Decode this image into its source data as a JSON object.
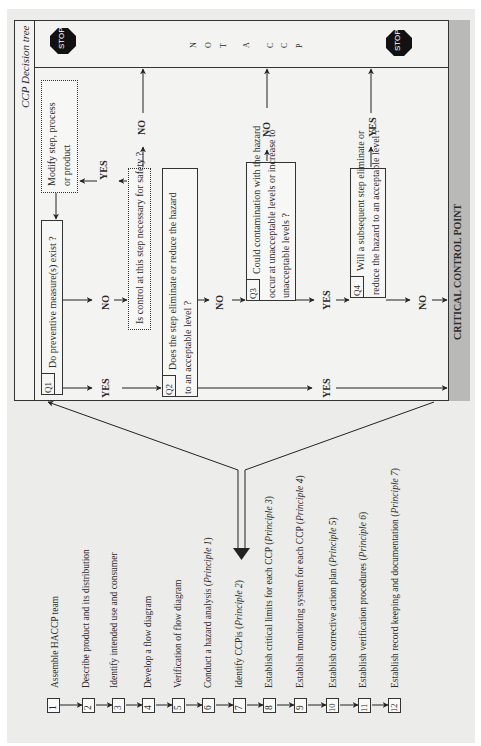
{
  "decision_tree": {
    "title": "CCP Decision tree",
    "not_a_ccp_label": "N O T   A   C C P",
    "not_a_ccp_letters": [
      "N",
      "O",
      "T",
      "",
      "A",
      "",
      "C",
      "C",
      "P"
    ],
    "stop_label": "STOP",
    "ccp_label": "CRITICAL CONTROL POINT",
    "questions": [
      {
        "tag": "Q1",
        "lines": [
          "Do preventive measure(s) exist ?"
        ]
      },
      {
        "tag": "Q2",
        "lines": [
          "Does the step eliminate or reduce the hazard",
          "to an acceptable level ?"
        ]
      },
      {
        "tag": "Q3",
        "lines": [
          "Could contamination with the hazard",
          "occur at unacceptable levels  or increase to",
          "unacceptable levels ?"
        ]
      },
      {
        "tag": "Q4",
        "lines": [
          "Will a subsequent step eliminate or",
          "reduce the hazard to an acceptable level ?"
        ]
      }
    ],
    "control_question": "Is control at this step necessary for safety ?",
    "modify_box": [
      "Modify step,  process",
      "or product"
    ],
    "answers": {
      "yes": "YES",
      "no": "NO"
    }
  },
  "steps": [
    {
      "num": "1",
      "text": "Assemble HACCP team",
      "principle": ""
    },
    {
      "num": "2",
      "text": "Describe product and its distribution",
      "principle": ""
    },
    {
      "num": "3",
      "text": "Identify intended use and consumer",
      "principle": ""
    },
    {
      "num": "4",
      "text": "Develop a flow diagram",
      "principle": ""
    },
    {
      "num": "5",
      "text": "Verification of flow diagram",
      "principle": ""
    },
    {
      "num": "6",
      "text": "Conduct a hazard analysis (",
      "principle": "Principle 1",
      "close": ")"
    },
    {
      "num": "7",
      "text": "Identify CCPis (",
      "principle": "Principle 2",
      "close": ")"
    },
    {
      "num": "8",
      "text": "Establish critical limits for each CCP (",
      "principle": "Principle 3",
      "close": ")"
    },
    {
      "num": "9",
      "text": "Establish monitoring system for each CCP (",
      "principle": "Principle 4",
      "close": ")"
    },
    {
      "num": "10",
      "text": "Establish corrective action plan (",
      "principle": "Principle 5",
      "close": ")"
    },
    {
      "num": "11",
      "text": "Establish verification procedures (",
      "principle": "Principle 6",
      "close": ")"
    },
    {
      "num": "12",
      "text": "Establish record keeping and documentation (",
      "principle": "Principle 7",
      "close": ")"
    }
  ]
}
